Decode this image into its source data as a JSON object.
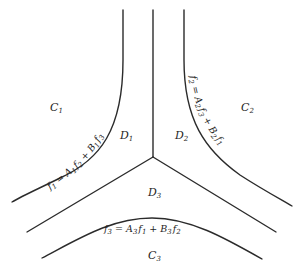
{
  "diagram": {
    "type": "region-boundary diagram",
    "colors": {
      "stroke": "#2b2b2b",
      "text": "#1e1e1e",
      "background": "#ffffff"
    },
    "regions": [
      {
        "id": "C1",
        "base": "C",
        "sub": "1"
      },
      {
        "id": "C2",
        "base": "C",
        "sub": "2"
      },
      {
        "id": "C3",
        "base": "C",
        "sub": "3"
      },
      {
        "id": "D1",
        "base": "D",
        "sub": "1"
      },
      {
        "id": "D2",
        "base": "D",
        "sub": "2"
      },
      {
        "id": "D3",
        "base": "D",
        "sub": "3"
      }
    ],
    "boundaries": [
      {
        "id": "f1",
        "equation": "f1 = A1 f2 + B1 f3",
        "parts": {
          "lhs": "f",
          "lhs_sub": "1",
          "eq": " = ",
          "a": "A",
          "a_sub": "1",
          "f_a": "f",
          "f_a_sub": "2",
          "plus": " + ",
          "b": "B",
          "b_sub": "1",
          "f_b": "f",
          "f_b_sub": "3"
        }
      },
      {
        "id": "f2",
        "equation": "f2 = A2 f3 + B2 f1",
        "parts": {
          "lhs": "f",
          "lhs_sub": "2",
          "eq": " = ",
          "a": "A",
          "a_sub": "2",
          "f_a": "f",
          "f_a_sub": "3",
          "plus": " + ",
          "b": "B",
          "b_sub": "2",
          "f_b": "f",
          "f_b_sub": "1"
        }
      },
      {
        "id": "f3",
        "equation": "f3 = A3 f1 + B3 f2",
        "parts": {
          "lhs": "f",
          "lhs_sub": "3",
          "eq": " = ",
          "a": "A",
          "a_sub": "3",
          "f_a": "f",
          "f_a_sub": "1",
          "plus": " + ",
          "b": "B",
          "b_sub": "3",
          "f_b": "f",
          "f_b_sub": "2"
        }
      }
    ]
  }
}
